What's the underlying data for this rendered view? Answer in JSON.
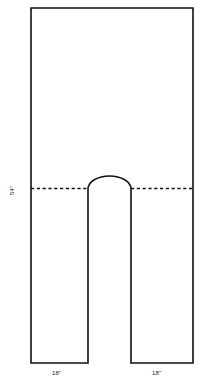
{
  "diagram": {
    "type": "technical-sewing-pattern",
    "background_color": "#ffffff",
    "line_color": "#111111",
    "shape": {
      "name": "rectangle-with-arched-notch",
      "description": "Rectangle with a rounded-top vertical slot removed from the bottom center, forming two legs",
      "top_edge_y": 8,
      "left_edge_x": 31,
      "right_edge_x": 193,
      "bottom_edge_y": 363,
      "notch_left_x": 88,
      "notch_right_x": 131,
      "notch_arch_top_y": 177,
      "notch_leg_start_y": 189
    },
    "fold_line": {
      "name": "fold-line",
      "style": "dashed",
      "y": 188,
      "from_x": 31,
      "to_x": 193
    },
    "labels": {
      "height_dimension": "54\"",
      "left_leg_dimension": "18\"",
      "right_leg_dimension": "18\""
    }
  }
}
